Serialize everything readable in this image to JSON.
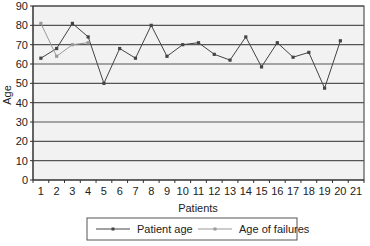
{
  "chart_data": {
    "type": "line",
    "title": "",
    "xlabel": "Patients",
    "ylabel": "Age",
    "ylim": [
      0,
      90
    ],
    "yticks": [
      0,
      10,
      20,
      30,
      40,
      50,
      60,
      70,
      80,
      90
    ],
    "categories": [
      "1",
      "2",
      "3",
      "4",
      "5",
      "6",
      "7",
      "8",
      "9",
      "10",
      "11",
      "12",
      "13",
      "14",
      "15",
      "16",
      "17",
      "18",
      "19",
      "20",
      "21"
    ],
    "grid": true,
    "legend_position": "bottom",
    "series": [
      {
        "name": "Patient age",
        "color": "#444444",
        "values": [
          63,
          68,
          81,
          74,
          50,
          68,
          63,
          80,
          64,
          70,
          71,
          65,
          62,
          74,
          58.5,
          71,
          63.5,
          66,
          47.5,
          72,
          null
        ]
      },
      {
        "name": "Age of failures",
        "color": "#999999",
        "values": [
          81,
          64,
          70,
          71,
          null,
          null,
          null,
          null,
          null,
          null,
          null,
          null,
          null,
          null,
          null,
          null,
          null,
          null,
          null,
          null,
          null
        ]
      }
    ]
  },
  "colors": {
    "plot_background": "#f2f2f2",
    "grid": "#555555",
    "axis": "#333333"
  }
}
